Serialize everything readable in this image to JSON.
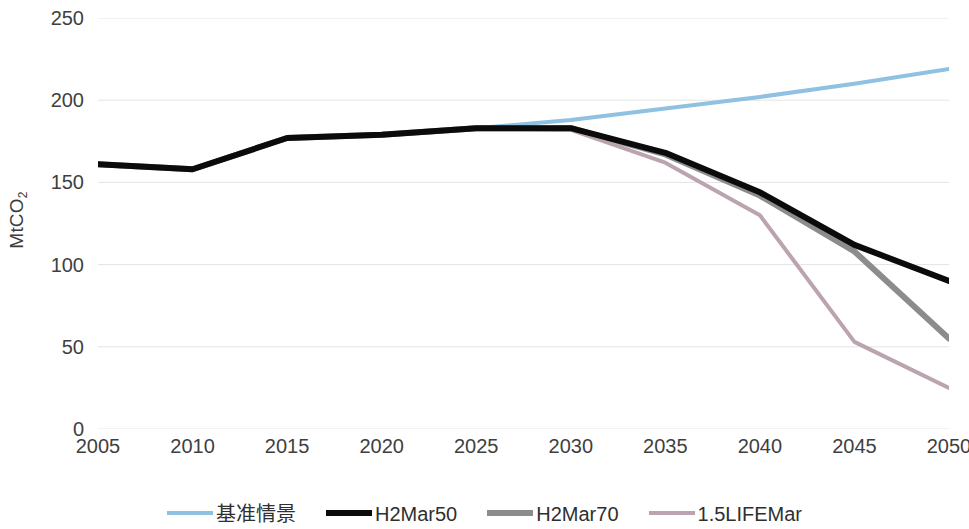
{
  "chart_data": {
    "type": "line",
    "title": "",
    "xlabel": "",
    "ylabel": "MtCO₂",
    "xlim": [
      2005,
      2050
    ],
    "ylim": [
      0,
      250
    ],
    "grid": true,
    "grid_axis": "y",
    "legend_position": "bottom",
    "x": [
      2005,
      2010,
      2015,
      2020,
      2025,
      2030,
      2035,
      2040,
      2045,
      2050
    ],
    "categories": [
      "2005",
      "2010",
      "2015",
      "2020",
      "2025",
      "2030",
      "2035",
      "2040",
      "2045",
      "2050"
    ],
    "series": [
      {
        "name": "基准情景",
        "color": "#8FC1E3",
        "width": 4,
        "values": [
          161,
          158,
          177,
          179,
          183,
          188,
          195,
          202,
          210,
          219
        ]
      },
      {
        "name": "H2Mar50",
        "color": "#0B0B0B",
        "width": 6,
        "values": [
          161,
          158,
          177,
          179,
          183,
          183,
          168,
          144,
          112,
          90
        ]
      },
      {
        "name": "H2Mar70",
        "color": "#8C8C8C",
        "width": 6,
        "values": [
          161,
          158,
          177,
          179,
          183,
          183,
          167,
          142,
          108,
          55
        ]
      },
      {
        "name": "1.5LIFEMar",
        "color": "#BBA3B0",
        "width": 4,
        "values": [
          161,
          158,
          177,
          179,
          183,
          182,
          162,
          130,
          53,
          25
        ]
      }
    ],
    "y_ticks": [
      {
        "value": 250,
        "label": "250"
      },
      {
        "value": 200,
        "label": "200"
      },
      {
        "value": 150,
        "label": "150"
      },
      {
        "value": 100,
        "label": "100"
      },
      {
        "value": 50,
        "label": "50"
      },
      {
        "value": 0,
        "label": "0"
      }
    ]
  },
  "axis": {
    "y_title": "MtCO",
    "y_title_sub": "2"
  },
  "legend": {
    "items": [
      {
        "label": "基准情景",
        "color": "#8FC1E3",
        "thickness": 4
      },
      {
        "label": "H2Mar50",
        "color": "#0B0B0B",
        "thickness": 6
      },
      {
        "label": "H2Mar70",
        "color": "#8C8C8C",
        "thickness": 6
      },
      {
        "label": "1.5LIFEMar",
        "color": "#BBA3B0",
        "thickness": 4
      }
    ]
  },
  "colors": {
    "background": "#FFFFFF",
    "gridline": "#E4E4E4",
    "axis_text": "#3F3F3F"
  }
}
